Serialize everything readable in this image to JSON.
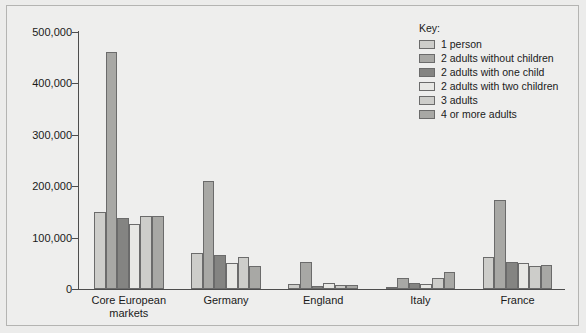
{
  "chart_data": {
    "type": "bar",
    "title": "",
    "subtitle": "",
    "xlabel": "",
    "ylabel": "",
    "ylim": [
      0,
      500000
    ],
    "ytick_labels": [
      "500,000",
      "400,000",
      "300,000",
      "200,000",
      "100,000",
      "0"
    ],
    "ytick_values": [
      500000,
      400000,
      300000,
      200000,
      100000,
      0
    ],
    "grid": false,
    "legend_position": "top-right",
    "legend_title": "Key:",
    "categories": [
      "Core European\nmarkets",
      "Germany",
      "England",
      "Italy",
      "France"
    ],
    "category_labels": [
      "Core European markets",
      "Germany",
      "England",
      "Italy",
      "France"
    ],
    "series": [
      {
        "name": "1 person",
        "color": "#cdcdca",
        "values": [
          150000,
          70000,
          10000,
          3000,
          62000
        ]
      },
      {
        "name": "2 adults without children",
        "color": "#a8a8a5",
        "values": [
          462000,
          210000,
          52000,
          22000,
          173000
        ]
      },
      {
        "name": "2 adults with one child",
        "color": "#848482",
        "values": [
          138000,
          66000,
          6000,
          12000,
          53000
        ]
      },
      {
        "name": "2 adults with two children",
        "color": "#e8e8e5",
        "values": [
          127000,
          51000,
          11000,
          9000,
          51000
        ]
      },
      {
        "name": "3 adults",
        "color": "#cdcdca",
        "values": [
          142000,
          63000,
          8000,
          22000,
          44000
        ]
      },
      {
        "name": "4 or more adults",
        "color": "#a8a8a5",
        "values": [
          142000,
          45000,
          8000,
          33000,
          47000
        ]
      }
    ]
  },
  "colors": {
    "figure_background": "#eeeeed",
    "frame_border": "#b4b4b2",
    "axis": "#4d4d4d",
    "bar_outline": "#6b6b6b",
    "text": "#1a1a1a"
  }
}
